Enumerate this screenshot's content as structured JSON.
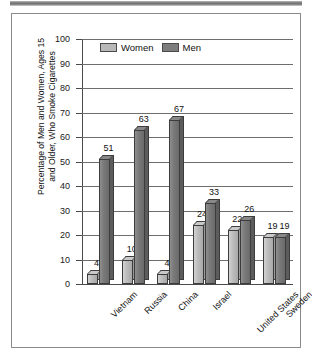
{
  "figure": {
    "frame_color": "#8a8a8a",
    "banner_color": "#6e6e6e"
  },
  "chart_data": {
    "type": "bar",
    "title": "",
    "xlabel": "",
    "ylabel": "Percentage of Men and Women, Ages 15\nand Older, Who Smoke Cigarettes",
    "ylim": [
      0,
      100
    ],
    "yticks": [
      "0",
      "10",
      "20",
      "30",
      "40",
      "50",
      "60",
      "70",
      "80",
      "90",
      "100"
    ],
    "grid": true,
    "legend_position": "top-left-inside",
    "categories": [
      "Vietnam",
      "Russia",
      "China",
      "Israel",
      "United States",
      "Sweden"
    ],
    "series": [
      {
        "name": "Women",
        "color": "#b8b8b8",
        "values": [
          4,
          10,
          4,
          24,
          22,
          19
        ]
      },
      {
        "name": "Men",
        "color": "#7d7d7d",
        "values": [
          51,
          63,
          67,
          33,
          26,
          19
        ]
      }
    ]
  }
}
